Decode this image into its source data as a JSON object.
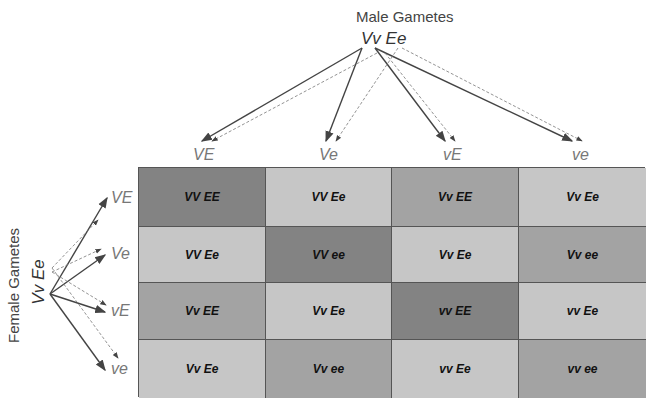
{
  "male": {
    "title": "Male Gametes",
    "parent": "Vv Ee",
    "gametes": [
      "VE",
      "Ve",
      "vE",
      "ve"
    ]
  },
  "female": {
    "title": "Female Gametes",
    "parent": "Vv Ee",
    "gametes": [
      "VE",
      "Ve",
      "vE",
      "ve"
    ]
  },
  "colors": {
    "dark": "#838383",
    "medium": "#a3a3a3",
    "light": "#c6c6c6"
  },
  "grid": [
    [
      {
        "g": "VV EE",
        "shade": "dark"
      },
      {
        "g": "VV Ee",
        "shade": "light"
      },
      {
        "g": "Vv EE",
        "shade": "medium"
      },
      {
        "g": "Vv Ee",
        "shade": "light"
      }
    ],
    [
      {
        "g": "VV Ee",
        "shade": "light"
      },
      {
        "g": "VV ee",
        "shade": "dark"
      },
      {
        "g": "Vv Ee",
        "shade": "light"
      },
      {
        "g": "Vv ee",
        "shade": "medium"
      }
    ],
    [
      {
        "g": "Vv EE",
        "shade": "medium"
      },
      {
        "g": "Vv Ee",
        "shade": "light"
      },
      {
        "g": "vv EE",
        "shade": "dark"
      },
      {
        "g": "vv Ee",
        "shade": "light"
      }
    ],
    [
      {
        "g": "Vv Ee",
        "shade": "light"
      },
      {
        "g": "Vv ee",
        "shade": "medium"
      },
      {
        "g": "vv Ee",
        "shade": "light"
      },
      {
        "g": "vv ee",
        "shade": "medium"
      }
    ]
  ]
}
